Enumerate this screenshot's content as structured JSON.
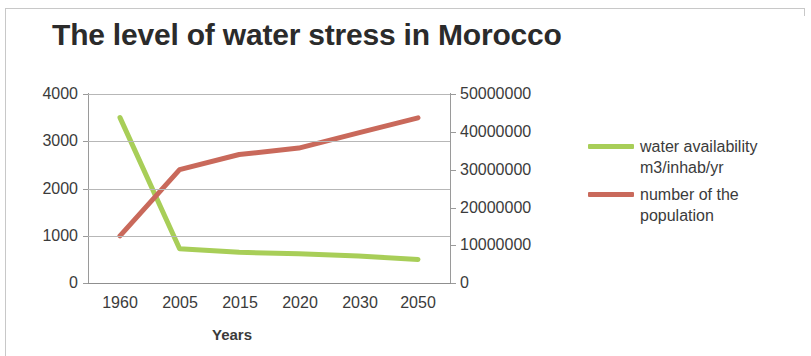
{
  "chart_data": {
    "type": "line",
    "title": "The level of water stress in Morocco",
    "xlabel": "Years",
    "ylabel": "",
    "categories": [
      "1960",
      "2005",
      "2015",
      "2020",
      "2030",
      "2050"
    ],
    "grid": true,
    "legend_position": "right",
    "axes": {
      "left": {
        "ticks": [
          "0",
          "1000",
          "2000",
          "3000",
          "4000"
        ],
        "min": 0,
        "max": 4000
      },
      "right": {
        "ticks": [
          "0",
          "10000000",
          "20000000",
          "30000000",
          "40000000",
          "50000000"
        ],
        "min": 0,
        "max": 50000000
      }
    },
    "series": [
      {
        "name": "water availability m3/inhab/yr",
        "axis": "left",
        "color": "#A8CE58",
        "values": [
          3500,
          725,
          650,
          620,
          570,
          500
        ]
      },
      {
        "name": "number of the population",
        "axis": "right",
        "color": "#C9695B",
        "values": [
          12500000,
          30000000,
          34000000,
          35700000,
          39700000,
          43700000
        ]
      }
    ]
  },
  "legend": {
    "items": [
      {
        "label": "water availability m3/inhab/yr",
        "color": "#A8CE58"
      },
      {
        "label": "number of the population",
        "color": "#C9695B"
      }
    ]
  }
}
